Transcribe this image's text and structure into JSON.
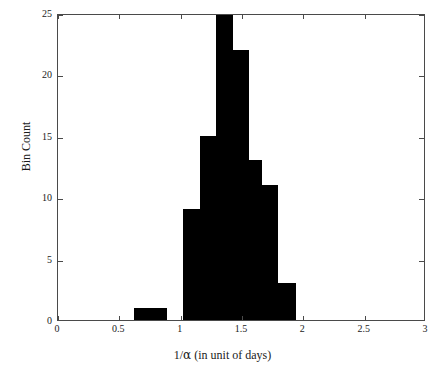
{
  "chart_data": {
    "type": "bar",
    "title": "",
    "subtitle": "",
    "xlabel": "1/α (in unit of days)",
    "ylabel": "Bin Count",
    "xlim": [
      0,
      3
    ],
    "ylim": [
      0,
      25
    ],
    "xticks": [
      "0",
      "0.5",
      "1",
      "1.5",
      "2",
      "2.5",
      "3"
    ],
    "xtick_values": [
      0,
      0.5,
      1,
      1.5,
      2,
      2.5,
      3
    ],
    "yticks": [
      "0",
      "5",
      "10",
      "15",
      "20",
      "25"
    ],
    "ytick_values": [
      0,
      5,
      10,
      15,
      20,
      25
    ],
    "grid": false,
    "legend": null,
    "bar_color": "#000000",
    "axis_color": "#4a4a4a",
    "bin_width": 0.135,
    "categories": [
      "0.62",
      "0.75",
      "1.02",
      "1.15",
      "1.29",
      "1.42",
      "1.56",
      "1.69",
      "1.82"
    ],
    "bins": [
      {
        "left": 0.62,
        "right": 0.755,
        "count": 1
      },
      {
        "left": 0.755,
        "right": 0.89,
        "count": 1
      },
      {
        "left": 1.02,
        "right": 1.155,
        "count": 9
      },
      {
        "left": 1.155,
        "right": 1.29,
        "count": 15
      },
      {
        "left": 1.29,
        "right": 1.425,
        "count": 25
      },
      {
        "left": 1.425,
        "right": 1.56,
        "count": 22
      },
      {
        "left": 1.56,
        "right": 1.66,
        "count": 13
      },
      {
        "left": 1.66,
        "right": 1.795,
        "count": 11
      },
      {
        "left": 1.795,
        "right": 1.94,
        "count": 3
      }
    ],
    "values": [
      1,
      1,
      9,
      15,
      25,
      22,
      13,
      11,
      3
    ]
  }
}
